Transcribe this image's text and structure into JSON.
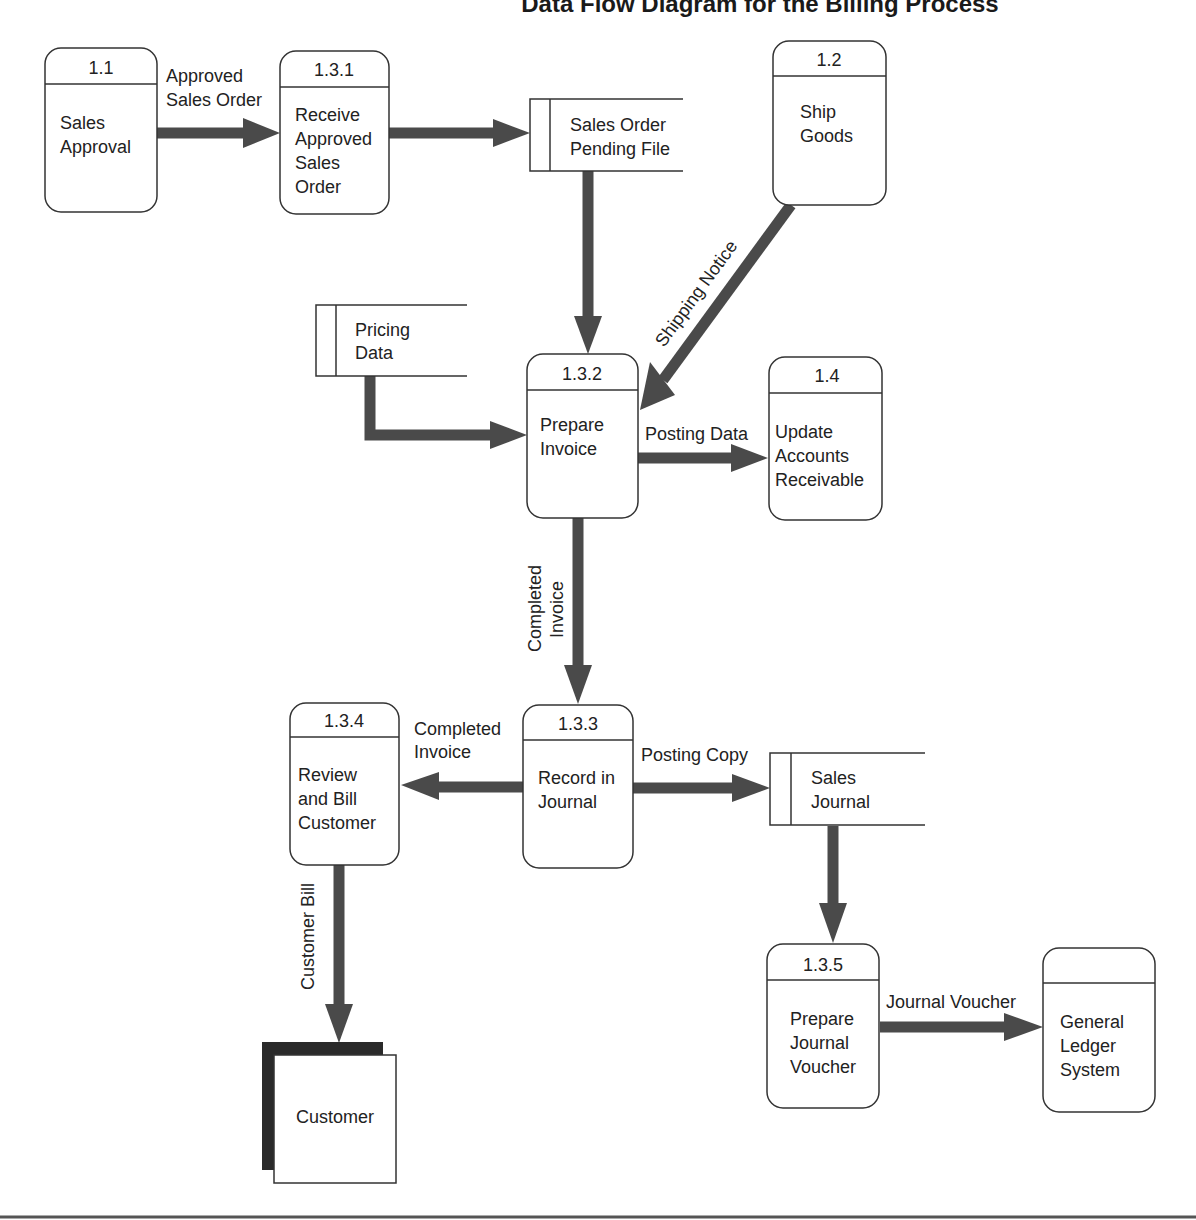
{
  "title": "Data Flow Diagram for the Billing Process",
  "title_visible_partial": "y ... Diagram for the Billing Process",
  "colors": {
    "background": "#ffffff",
    "outline": "#333333",
    "flow_arrow": "#4a4a4a",
    "text": "#222222",
    "entity_shadow": "#2a2a2a"
  },
  "processes": [
    {
      "id": "1.1",
      "label_lines": [
        "Sales",
        "Approval"
      ]
    },
    {
      "id": "1.3.1",
      "label_lines": [
        "Receive",
        "Approved",
        "Sales",
        "Order"
      ]
    },
    {
      "id": "1.2",
      "label_lines": [
        "Ship",
        "Goods"
      ]
    },
    {
      "id": "1.3.2",
      "label_lines": [
        "Prepare",
        "Invoice"
      ]
    },
    {
      "id": "1.4",
      "label_lines": [
        "Update",
        "Accounts",
        "Receivable"
      ]
    },
    {
      "id": "1.3.4",
      "label_lines": [
        "Review",
        "and Bill",
        "Customer"
      ]
    },
    {
      "id": "1.3.3",
      "label_lines": [
        "Record in",
        "Journal"
      ]
    },
    {
      "id": "1.3.5",
      "label_lines": [
        "Prepare",
        "Journal",
        "Voucher"
      ]
    },
    {
      "id": "",
      "label_lines": [
        "General",
        "Ledger",
        "System"
      ]
    }
  ],
  "data_stores": [
    {
      "label_lines": [
        "Sales Order",
        "Pending File"
      ]
    },
    {
      "label_lines": [
        "Pricing",
        "Data"
      ]
    },
    {
      "label_lines": [
        "Sales",
        "Journal"
      ]
    }
  ],
  "external_entities": [
    {
      "label": "Customer"
    }
  ],
  "flows": [
    {
      "from": "1.1",
      "to": "1.3.1",
      "label_lines": [
        "Approved",
        "Sales Order"
      ]
    },
    {
      "from": "1.3.1",
      "to": "Sales Order Pending File",
      "label_lines": []
    },
    {
      "from": "Sales Order Pending File",
      "to": "1.3.2",
      "label_lines": []
    },
    {
      "from": "1.2",
      "to": "1.3.2",
      "label_lines": [
        "Shipping Notice"
      ]
    },
    {
      "from": "Pricing Data",
      "to": "1.3.2",
      "label_lines": []
    },
    {
      "from": "1.3.2",
      "to": "1.4",
      "label_lines": [
        "Posting Data"
      ]
    },
    {
      "from": "1.3.2",
      "to": "1.3.3",
      "label_lines": [
        "Completed",
        "Invoice"
      ]
    },
    {
      "from": "1.3.3",
      "to": "1.3.4",
      "label_lines": [
        "Completed",
        "Invoice"
      ]
    },
    {
      "from": "1.3.3",
      "to": "Sales Journal",
      "label_lines": [
        "Posting Copy"
      ]
    },
    {
      "from": "1.3.4",
      "to": "Customer",
      "label_lines": [
        "Customer Bill"
      ]
    },
    {
      "from": "Sales Journal",
      "to": "1.3.5",
      "label_lines": []
    },
    {
      "from": "1.3.5",
      "to": "General Ledger System",
      "label_lines": [
        "Journal Voucher"
      ]
    }
  ]
}
